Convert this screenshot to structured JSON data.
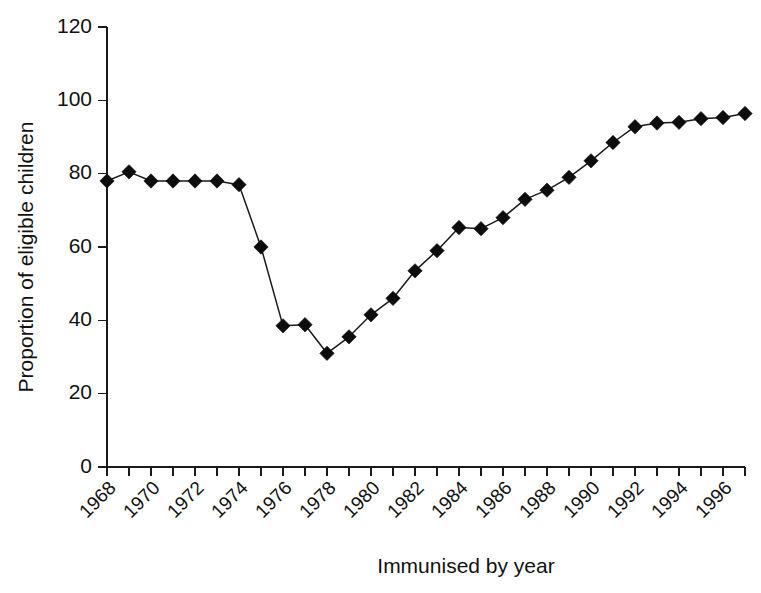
{
  "chart_data": {
    "type": "line",
    "title": "",
    "xlabel": "Immunised by year",
    "ylabel": "Proportion of eligible children",
    "xlim": [
      1968,
      1997
    ],
    "ylim": [
      0,
      120
    ],
    "grid": false,
    "legend": null,
    "marker": "filled-diamond",
    "y_ticks": [
      0,
      20,
      40,
      60,
      80,
      100,
      120
    ],
    "y_tick_labels": [
      "0",
      "20",
      "40",
      "60",
      "80",
      "100",
      "120"
    ],
    "x_ticks": [
      1968,
      1969,
      1970,
      1971,
      1972,
      1973,
      1974,
      1975,
      1976,
      1977,
      1978,
      1979,
      1980,
      1981,
      1982,
      1983,
      1984,
      1985,
      1986,
      1987,
      1988,
      1989,
      1990,
      1991,
      1992,
      1993,
      1994,
      1995,
      1996,
      1997
    ],
    "x_tick_labels": [
      "1968",
      "",
      "1970",
      "",
      "1972",
      "",
      "1974",
      "",
      "1976",
      "",
      "1978",
      "",
      "1980",
      "",
      "1982",
      "",
      "1984",
      "",
      "1986",
      "",
      "1988",
      "",
      "1990",
      "",
      "1992",
      "",
      "1994",
      "",
      "1996",
      ""
    ],
    "x_tick_label_rotation": 45,
    "x": [
      1968,
      1969,
      1970,
      1971,
      1972,
      1973,
      1974,
      1975,
      1976,
      1977,
      1978,
      1979,
      1980,
      1981,
      1982,
      1983,
      1984,
      1985,
      1986,
      1987,
      1988,
      1989,
      1990,
      1991,
      1992,
      1993,
      1994,
      1995,
      1996,
      1997
    ],
    "values": [
      78,
      80.5,
      78,
      78,
      78,
      78,
      77,
      60,
      38.5,
      38.8,
      31,
      35.5,
      41.5,
      46,
      53.5,
      59,
      65.3,
      65,
      68,
      73,
      75.5,
      79,
      83.5,
      88.5,
      92.8,
      93.8,
      94,
      95,
      95.3,
      96.4
    ],
    "series": [
      {
        "name": "Proportion of eligible children immunised",
        "values": [
          78,
          80.5,
          78,
          78,
          78,
          78,
          77,
          60,
          38.5,
          38.8,
          31,
          35.5,
          41.5,
          46,
          53.5,
          59,
          65.3,
          65,
          68,
          73,
          75.5,
          79,
          83.5,
          88.5,
          92.8,
          93.8,
          94,
          95,
          95.3,
          96.4
        ]
      }
    ],
    "colors": {
      "line": "#1a1a1a",
      "marker": "#0d0d0d",
      "axis": "#1a1a1a",
      "background": "#ffffff",
      "text": "#111111"
    }
  }
}
